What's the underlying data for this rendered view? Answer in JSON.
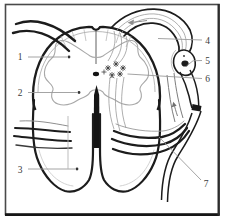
{
  "figure": {
    "type": "anatomical-line-diagram",
    "labels": [
      {
        "text": "1"
      },
      {
        "text": "2"
      },
      {
        "text": "3"
      },
      {
        "text": "4"
      },
      {
        "text": "5"
      },
      {
        "text": "6"
      },
      {
        "text": "7"
      }
    ],
    "colors": {
      "background": "#ffffff",
      "frame": "#4a4a4a",
      "heavy_outline": "#1c1c1c",
      "light_detail": "#9a9a9a",
      "label_text": "#3a3a3a"
    }
  }
}
